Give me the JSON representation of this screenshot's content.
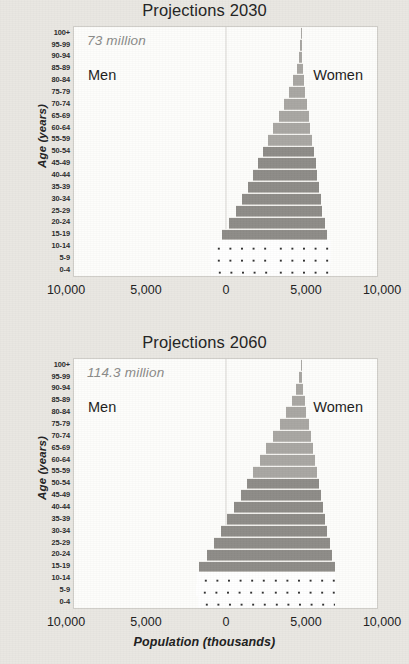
{
  "figure": {
    "axis_x_title": "Population (thousands)",
    "axis_y_title": "Age (years)"
  },
  "panels": [
    {
      "title": "Projections 2030",
      "total": "73 million",
      "left_label": "Men",
      "right_label": "Women"
    },
    {
      "title": "Projections 2060",
      "total": "114.3 million",
      "left_label": "Men",
      "right_label": "Women"
    }
  ],
  "xticks": [
    {
      "label": "10,000",
      "px": 66
    },
    {
      "label": "5,000",
      "px": 146
    },
    {
      "label": "0",
      "px": 226
    },
    {
      "label": "5,000",
      "px": 306
    },
    {
      "label": "10,000",
      "px": 382
    }
  ],
  "chart_data": [
    {
      "type": "bar",
      "subtype": "population-pyramid",
      "title": "Projections 2030",
      "annotation": "73 million",
      "xlabel": "Population (thousands)",
      "ylabel": "Age (years)",
      "xlim": [
        -11600,
        11600
      ],
      "xticks": [
        10000,
        5000,
        0,
        5000,
        10000
      ],
      "xtick_labels": [
        "10,000",
        "5,000",
        "0",
        "5,000",
        "10,000"
      ],
      "grid": false,
      "legend": [
        "Men",
        "Women"
      ],
      "legend_position": "inside-top-left-and-top-right",
      "categories": [
        "0-4",
        "5-9",
        "10-14",
        "15-19",
        "20-24",
        "25-29",
        "30-34",
        "35-39",
        "40-44",
        "45-49",
        "50-54",
        "55-59",
        "60-64",
        "65-69",
        "70-74",
        "75-79",
        "80-84",
        "85-89",
        "90-94",
        "95-99",
        "100+"
      ],
      "series": [
        {
          "name": "Men",
          "values": [
            4650,
            4750,
            4700,
            4100,
            3700,
            3350,
            3050,
            2750,
            2500,
            2250,
            1980,
            1700,
            1420,
            1150,
            880,
            620,
            400,
            230,
            110,
            40,
            10
          ]
        },
        {
          "name": "Women",
          "values": [
            4450,
            4550,
            4500,
            3950,
            3600,
            3250,
            2950,
            2680,
            2430,
            2200,
            1940,
            1680,
            1410,
            1150,
            890,
            640,
            430,
            260,
            130,
            50,
            14
          ]
        }
      ]
    },
    {
      "type": "bar",
      "subtype": "population-pyramid",
      "title": "Projections 2060",
      "annotation": "114.3 million",
      "xlabel": "Population (thousands)",
      "ylabel": "Age (years)",
      "xlim": [
        -11600,
        11600
      ],
      "xticks": [
        10000,
        5000,
        0,
        5000,
        10000
      ],
      "xtick_labels": [
        "10,000",
        "5,000",
        "0",
        "5,000",
        "10,000"
      ],
      "grid": false,
      "legend": [
        "Men",
        "Women"
      ],
      "legend_position": "inside-top-left-and-top-right",
      "categories": [
        "0-4",
        "5-9",
        "10-14",
        "15-19",
        "20-24",
        "25-29",
        "30-34",
        "35-39",
        "40-44",
        "45-49",
        "50-54",
        "55-59",
        "60-64",
        "65-69",
        "70-74",
        "75-79",
        "80-84",
        "85-89",
        "90-94",
        "95-99",
        "100+"
      ],
      "series": [
        {
          "name": "Men",
          "values": [
            5350,
            5450,
            5400,
            5300,
            4850,
            4500,
            4150,
            3800,
            3450,
            3100,
            2780,
            2450,
            2120,
            1780,
            1430,
            1080,
            740,
            450,
            230,
            90,
            20
          ]
        },
        {
          "name": "Women",
          "values": [
            5150,
            5250,
            5200,
            5100,
            4700,
            4350,
            4020,
            3700,
            3380,
            3050,
            2740,
            2420,
            2110,
            1790,
            1460,
            1130,
            800,
            510,
            280,
            110,
            26
          ]
        }
      ]
    }
  ],
  "colors": {
    "bar_fill": "#a9a7a3",
    "bar_fill_dark": "#8e8c88",
    "plot_background": "#fdfdfb",
    "page_background": "#e9e7e2",
    "annotation_text": "#8a8a88"
  }
}
